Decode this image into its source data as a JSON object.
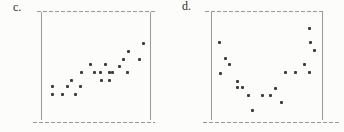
{
  "figure": {
    "background": "#fcfcfa",
    "line_color": "#989898",
    "dot_color": "#3d3d3d",
    "label_color": "#2f2f2f"
  },
  "chart_data": [
    {
      "type": "scatter",
      "label": "c.",
      "title": "",
      "xlabel": "",
      "ylabel": "",
      "axes_labeled": false,
      "pattern": "positive linear association",
      "xlim": [
        0,
        100
      ],
      "ylim": [
        0,
        100
      ],
      "points": [
        [
          9,
          30
        ],
        [
          9,
          23
        ],
        [
          18,
          23
        ],
        [
          23,
          30
        ],
        [
          27,
          36
        ],
        [
          31,
          23
        ],
        [
          35,
          30
        ],
        [
          36,
          44
        ],
        [
          45,
          51
        ],
        [
          49,
          44
        ],
        [
          54,
          44
        ],
        [
          55,
          36
        ],
        [
          59,
          51
        ],
        [
          63,
          44
        ],
        [
          63,
          36
        ],
        [
          66,
          44
        ],
        [
          72,
          50
        ],
        [
          76,
          56
        ],
        [
          80,
          44
        ],
        [
          81,
          64
        ],
        [
          91,
          56
        ],
        [
          95,
          72
        ]
      ]
    },
    {
      "type": "scatter",
      "label": "d.",
      "title": "",
      "xlabel": "",
      "ylabel": "",
      "axes_labeled": false,
      "pattern": "U-shaped curvilinear association",
      "xlim": [
        0,
        100
      ],
      "ylim": [
        0,
        100
      ],
      "points": [
        [
          6,
          73
        ],
        [
          7,
          43
        ],
        [
          12,
          57
        ],
        [
          15,
          51
        ],
        [
          23,
          35
        ],
        [
          23,
          29
        ],
        [
          27,
          29
        ],
        [
          33,
          22
        ],
        [
          37,
          7
        ],
        [
          46,
          22
        ],
        [
          53,
          22
        ],
        [
          58,
          28
        ],
        [
          63,
          15
        ],
        [
          67,
          44
        ],
        [
          76,
          44
        ],
        [
          85,
          51
        ],
        [
          89,
          86
        ],
        [
          89,
          44
        ],
        [
          90,
          73
        ],
        [
          94,
          65
        ]
      ]
    }
  ]
}
